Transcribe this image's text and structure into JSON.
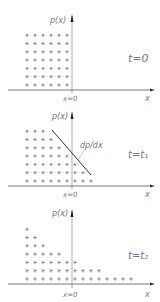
{
  "panels": [
    {
      "id": "t0",
      "y_label": "p(x)",
      "x_label": "x",
      "origin_label": "x=0",
      "time_label": "t=0",
      "row_counts_top_to_bottom": [
        6,
        6,
        6,
        6,
        6,
        6,
        6
      ]
    },
    {
      "id": "t1",
      "y_label": "p(x)",
      "x_label": "x",
      "origin_label": "x=0",
      "time_label": "t=t₁",
      "gradient_label": "dp/dx",
      "row_counts_top_to_bottom": [
        3,
        4,
        5,
        6,
        7,
        8,
        9
      ]
    },
    {
      "id": "t2",
      "y_label": "p(x)",
      "x_label": "x",
      "origin_label": "x=0",
      "time_label": "t=t₂",
      "row_counts_top_to_bottom": [
        1,
        2,
        3,
        5,
        7,
        10,
        14
      ]
    }
  ],
  "colors": {
    "axis": "#555555",
    "label": "#777777",
    "marker": "#555555"
  }
}
